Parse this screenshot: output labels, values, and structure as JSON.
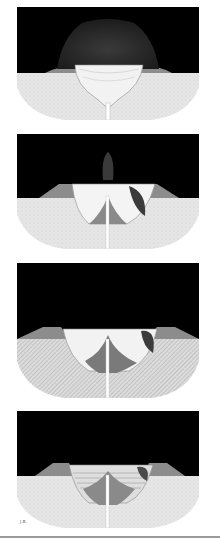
{
  "figure": {
    "panels": [
      {
        "index": 1,
        "stage": "eruption-column-over-magma-chamber"
      },
      {
        "index": 2,
        "stage": "collapse-with-small-plume"
      },
      {
        "index": 3,
        "stage": "caldera-with-central-cone"
      },
      {
        "index": 4,
        "stage": "caldera-lake-infill"
      }
    ],
    "signature": "J.B.",
    "colors": {
      "sky": "#000000",
      "ground": "#e4e4e4",
      "rim": "#8c8c8c",
      "cone": "#7a7a7a",
      "chamber": "#f2f2f2",
      "conduit": "#ffffff",
      "rule": "#9a9a9a"
    }
  }
}
